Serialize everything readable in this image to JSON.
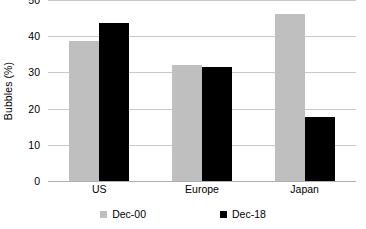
{
  "chart_data": {
    "type": "bar",
    "title": "",
    "subtitle": "",
    "xlabel": "",
    "ylabel": "Bubbles (%)",
    "categories": [
      "US",
      "Europe",
      "Japan"
    ],
    "series": [
      {
        "name": "Dec-00",
        "color": "#bfbfbf",
        "values": [
          38.8,
          32.1,
          46.2
        ]
      },
      {
        "name": "Dec-18",
        "color": "#000000",
        "values": [
          43.6,
          31.4,
          17.8
        ]
      }
    ],
    "ylim": [
      0,
      50
    ],
    "yticks": [
      0,
      10,
      20,
      30,
      40,
      50
    ],
    "ytick_labels": [
      "0",
      "10",
      "20",
      "30",
      "40",
      "50"
    ],
    "grid": "horizontal",
    "legend_position": "bottom",
    "gridline_color": "#c8c8c8",
    "background_color": "#ffffff"
  }
}
